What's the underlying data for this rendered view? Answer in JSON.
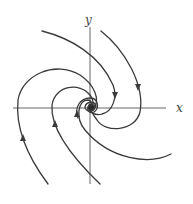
{
  "diagram": {
    "type": "phase-portrait",
    "axes": {
      "x_label": "x",
      "y_label": "y"
    },
    "trajectory_count": 6,
    "arrow_direction": "toward origin",
    "colors": {
      "curves": "#3a3a3a",
      "axes": "#555555",
      "background": "#ffffff"
    }
  }
}
